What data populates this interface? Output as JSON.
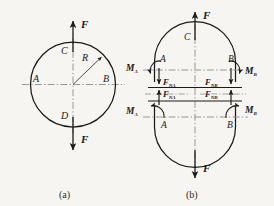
{
  "figure": {
    "kind": "engineering-mechanics-free-body-diagram",
    "background_color": "#f6f5f1",
    "ink_color": "#1a1a1a",
    "centerline_color": "#8a8a8a",
    "captions": [
      {
        "id": "a",
        "text": "(a)"
      },
      {
        "id": "b",
        "text": "(b)"
      }
    ],
    "panel_a": {
      "caption": "(a)",
      "shape": "circle",
      "points": {
        "top": "C",
        "bottom": "D",
        "left": "A",
        "right": "B"
      },
      "radius_label": "R",
      "force_top": "F",
      "force_bottom": "F",
      "centerlines": [
        "vertical",
        "horizontal"
      ]
    },
    "panel_b": {
      "caption": "(b)",
      "shape": "split-ring",
      "force_top": "F",
      "force_bottom": "F",
      "top_half": {
        "apex_label": "C",
        "cut_left_point": "A",
        "cut_right_point": "B",
        "moment_left": {
          "symbol": "M",
          "sub": "A"
        },
        "moment_right": {
          "symbol": "M",
          "sub": "B"
        },
        "normal_left": {
          "symbol": "F",
          "sub": "NA"
        },
        "normal_right": {
          "symbol": "F",
          "sub": "NB"
        }
      },
      "bottom_half": {
        "cut_left_point": "A",
        "cut_right_point": "B",
        "moment_left": {
          "symbol": "M",
          "sub": "A"
        },
        "moment_right": {
          "symbol": "M",
          "sub": "B"
        },
        "normal_left": {
          "symbol": "F",
          "sub": "NA"
        },
        "normal_right": {
          "symbol": "F",
          "sub": "NB"
        }
      }
    }
  }
}
